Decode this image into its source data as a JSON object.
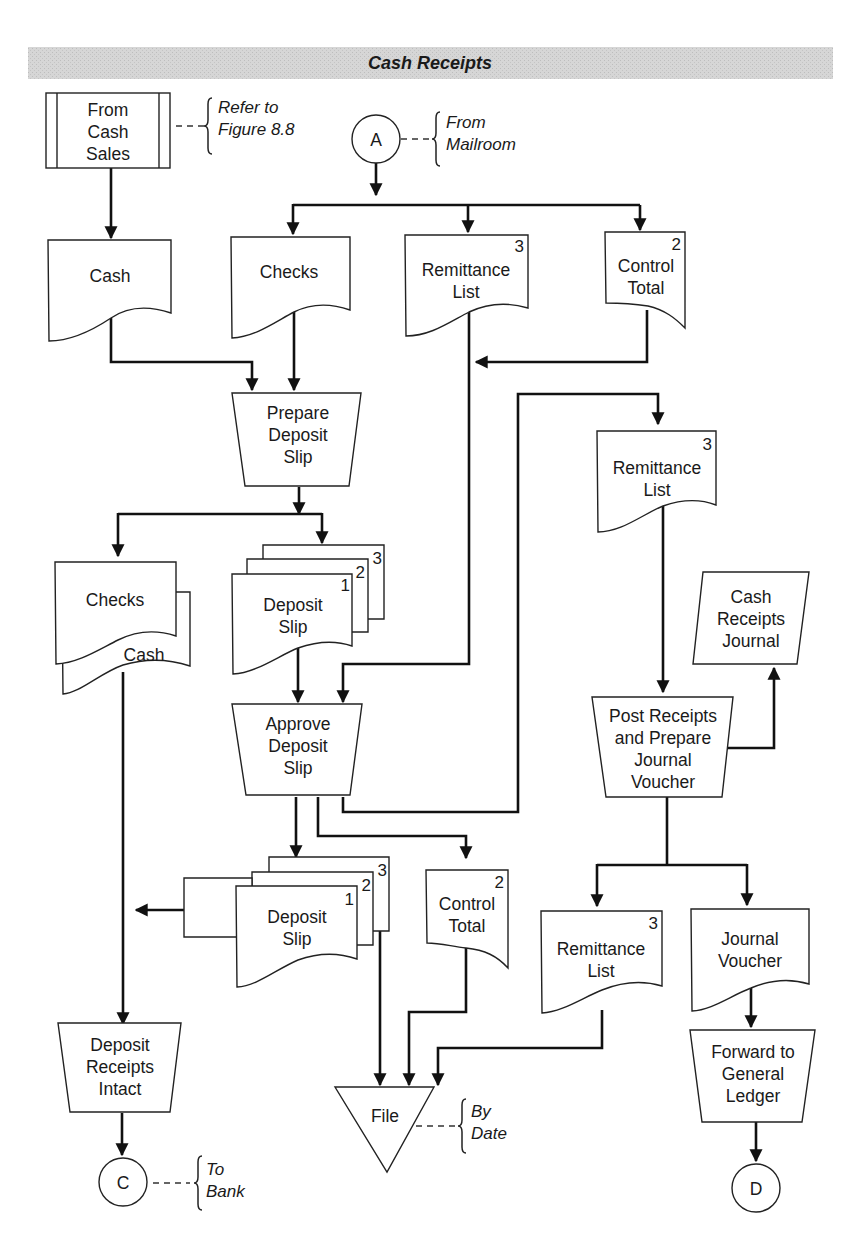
{
  "header": {
    "title": "Cash Receipts",
    "band_color": "#d4d4d4"
  },
  "nodes": {
    "from_cash_sales": {
      "lines": [
        "From",
        "Cash",
        "Sales"
      ],
      "annotation": [
        "Refer to",
        "Figure 8.8"
      ]
    },
    "connector_a": {
      "label": "A",
      "annotation": [
        "From",
        "Mailroom"
      ]
    },
    "cash_doc": {
      "lines": [
        "Cash"
      ]
    },
    "checks_doc": {
      "lines": [
        "Checks"
      ]
    },
    "remittance_list_1": {
      "lines": [
        "Remittance",
        "List"
      ],
      "copy": "3"
    },
    "control_total_1": {
      "lines": [
        "Control",
        "Total"
      ],
      "copy": "2"
    },
    "prepare_deposit_slip": {
      "lines": [
        "Prepare",
        "Deposit",
        "Slip"
      ]
    },
    "checks_cash_docs": {
      "front": "Checks",
      "back": "Cash"
    },
    "deposit_slip_1": {
      "lines": [
        "Deposit",
        "Slip"
      ],
      "copies": [
        "1",
        "2",
        "3"
      ]
    },
    "remittance_list_2": {
      "lines": [
        "Remittance",
        "List"
      ],
      "copy": "3"
    },
    "cash_receipts_journal": {
      "lines": [
        "Cash",
        "Receipts",
        "Journal"
      ]
    },
    "approve_deposit_slip": {
      "lines": [
        "Approve",
        "Deposit",
        "Slip"
      ]
    },
    "post_receipts": {
      "lines": [
        "Post Receipts",
        "and Prepare",
        "Journal",
        "Voucher"
      ]
    },
    "deposit_slip_2": {
      "lines": [
        "Deposit",
        "Slip"
      ],
      "copies": [
        "1",
        "2",
        "3"
      ]
    },
    "control_total_2": {
      "lines": [
        "Control",
        "Total"
      ],
      "copy": "2"
    },
    "remittance_list_3": {
      "lines": [
        "Remittance",
        "List"
      ],
      "copy": "3"
    },
    "journal_voucher": {
      "lines": [
        "Journal",
        "Voucher"
      ]
    },
    "deposit_receipts_intact": {
      "lines": [
        "Deposit",
        "Receipts",
        "Intact"
      ]
    },
    "file": {
      "label": "File",
      "annotation": [
        "By",
        "Date"
      ]
    },
    "forward_to_gl": {
      "lines": [
        "Forward to",
        "General",
        "Ledger"
      ]
    },
    "connector_c": {
      "label": "C",
      "annotation": [
        "To",
        "Bank"
      ]
    },
    "connector_d": {
      "label": "D"
    }
  }
}
